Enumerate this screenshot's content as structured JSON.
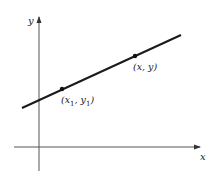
{
  "diagram": {
    "type": "coordinate-line",
    "axes": {
      "x_label": "x",
      "y_label": "y"
    },
    "points": [
      {
        "id": "p1",
        "label_main": "(x",
        "sub1": "1",
        "sep": ", y",
        "sub2": "1",
        "close": ")"
      },
      {
        "id": "p",
        "label": "(x, y)"
      }
    ],
    "colors": {
      "line": "#1a1a1a",
      "axis": "#444444",
      "text": "#222222"
    }
  }
}
